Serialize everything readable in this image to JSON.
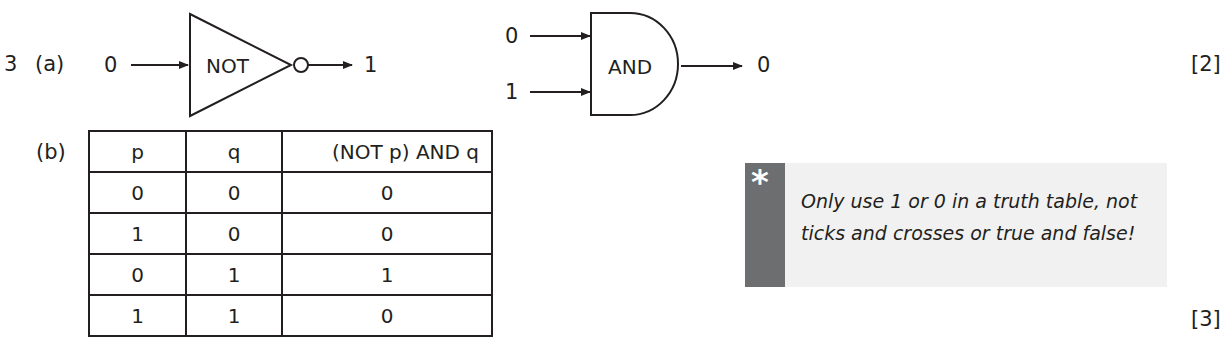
{
  "question": {
    "number": "3",
    "part_a": {
      "label": "(a)",
      "marks": "[2]",
      "not_gate": {
        "input": "0",
        "gate": "NOT",
        "output": "1"
      },
      "and_gate": {
        "input_1": "0",
        "input_2": "1",
        "gate": "AND",
        "output": "0"
      }
    },
    "part_b": {
      "label": "(b)",
      "marks": "[3]",
      "table": {
        "headers": [
          "p",
          "q",
          "(NOT p) AND q"
        ],
        "rows": [
          [
            "0",
            "0",
            "0"
          ],
          [
            "1",
            "0",
            "0"
          ],
          [
            "0",
            "1",
            "1"
          ],
          [
            "1",
            "1",
            "0"
          ]
        ]
      }
    },
    "tip": {
      "icon": "asterisk-icon",
      "symbol": "*",
      "text": "Only use 1 or 0 in a truth table, not ticks and crosses or true and false!",
      "bar_color": "#6d6e70",
      "background_color": "#f1f1f1"
    }
  }
}
